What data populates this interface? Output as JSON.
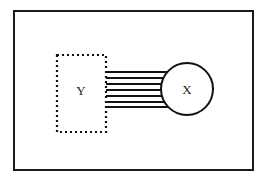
{
  "diagram": {
    "frame": {
      "stroke": "#1a1a1a"
    },
    "nodes": [
      {
        "id": "Y",
        "label": "Y",
        "shape": "rectangle",
        "border": "dotted"
      },
      {
        "id": "X",
        "label": "X",
        "shape": "circle",
        "border": "solid"
      }
    ],
    "edges": [
      {
        "from": "Y",
        "to": "X",
        "count": 6,
        "style": "parallel-lines"
      }
    ],
    "colors": {
      "line": "#111111",
      "background": "#ffffff"
    }
  }
}
